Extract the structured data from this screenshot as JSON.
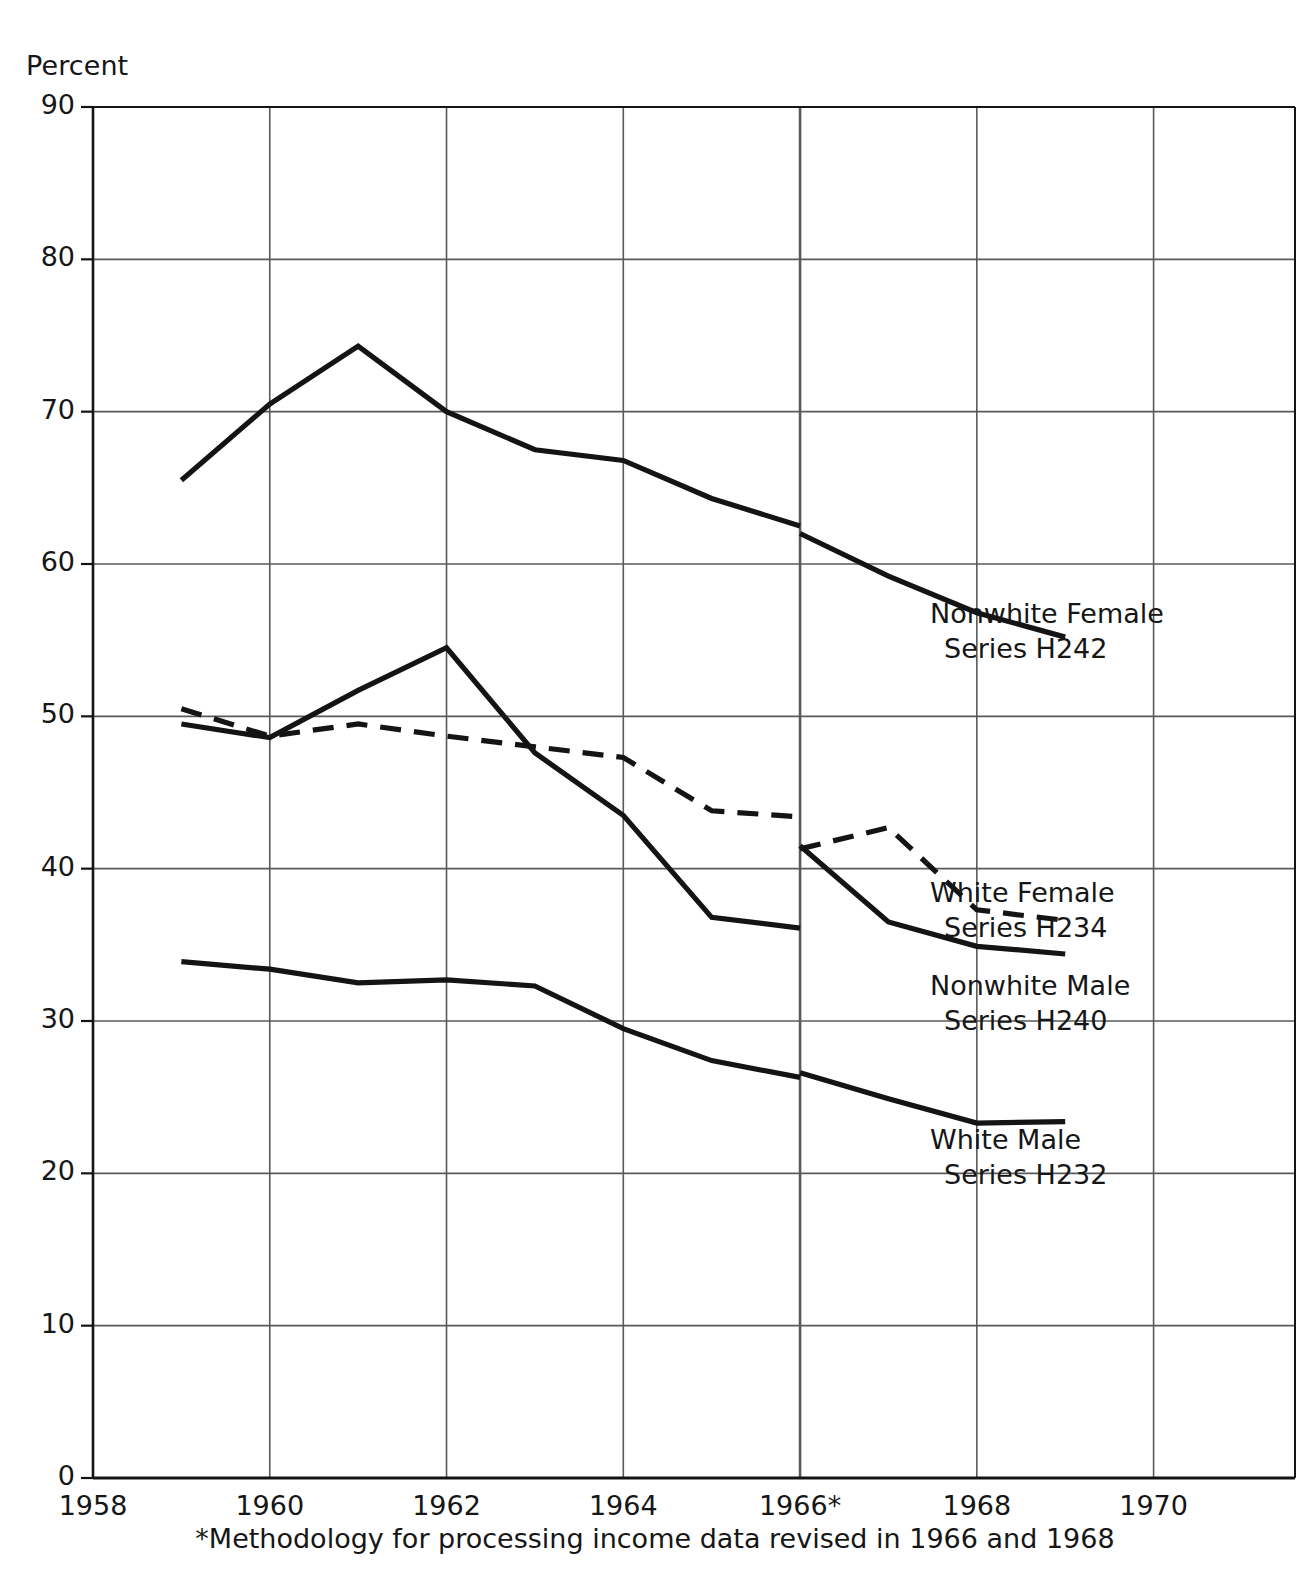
{
  "chart_data": {
    "type": "line",
    "title": "",
    "xlabel": "",
    "ylabel": "Percent",
    "xlim": [
      1958,
      1971.6
    ],
    "ylim": [
      0,
      90
    ],
    "grid": true,
    "legend_position": "inline-right",
    "ytick_labels": [
      "0",
      "10",
      "20",
      "30",
      "40",
      "50",
      "60",
      "70",
      "80",
      "90"
    ],
    "ytick_values": [
      0,
      10,
      20,
      30,
      40,
      50,
      60,
      70,
      80,
      90
    ],
    "xtick_labels": [
      "1958",
      "1960",
      "1962",
      "1964",
      "1966*",
      "1968",
      "1970"
    ],
    "xtick_values": [
      1958,
      1960,
      1962,
      1964,
      1966,
      1968,
      1970
    ],
    "annotations": [
      "*Methodology for processing income data revised in 1966 and 1968"
    ],
    "breaks": [
      1966,
      1968
    ],
    "series": [
      {
        "name": "Nonwhite Female",
        "code": "Series H242",
        "style": "solid",
        "label_line1": "Nonwhite Female",
        "label_line2": "Series H242",
        "segments": [
          {
            "x": [
              1959,
              1960,
              1961,
              1962,
              1963,
              1964,
              1965,
              1966
            ],
            "y": [
              65.5,
              70.5,
              74.3,
              70.0,
              67.5,
              66.8,
              64.3,
              62.5
            ]
          },
          {
            "x": [
              1966,
              1967,
              1968,
              1969
            ],
            "y": [
              62.0,
              59.2,
              56.8,
              55.2
            ]
          }
        ]
      },
      {
        "name": "White Female",
        "code": "Series H234",
        "style": "dashed",
        "label_line1": "White Female",
        "label_line2": "Series H234",
        "segments": [
          {
            "x": [
              1959,
              1960,
              1961,
              1962,
              1963,
              1964,
              1965,
              1966
            ],
            "y": [
              50.5,
              48.7,
              49.5,
              48.7,
              48.0,
              47.3,
              43.8,
              43.4
            ]
          },
          {
            "x": [
              1966,
              1967,
              1968,
              1969
            ],
            "y": [
              41.3,
              42.7,
              37.3,
              36.6
            ]
          }
        ]
      },
      {
        "name": "Nonwhite Male",
        "code": "Series H240",
        "style": "solid",
        "label_line1": "Nonwhite Male",
        "label_line2": "Series H240",
        "segments": [
          {
            "x": [
              1959,
              1960,
              1961,
              1962,
              1963,
              1964,
              1965,
              1966
            ],
            "y": [
              49.5,
              48.6,
              51.7,
              54.5,
              47.6,
              43.5,
              36.8,
              36.1
            ]
          },
          {
            "x": [
              1966,
              1967,
              1968,
              1969
            ],
            "y": [
              41.5,
              36.5,
              34.9,
              34.4
            ]
          }
        ]
      },
      {
        "name": "White Male",
        "code": "Series H232",
        "style": "solid",
        "label_line1": "White Male",
        "label_line2": "Series H232",
        "segments": [
          {
            "x": [
              1959,
              1960,
              1961,
              1962,
              1963,
              1964,
              1965,
              1966
            ],
            "y": [
              33.9,
              33.4,
              32.5,
              32.7,
              32.3,
              29.5,
              27.4,
              26.3
            ]
          },
          {
            "x": [
              1966,
              1967,
              1968,
              1969
            ],
            "y": [
              26.6,
              24.9,
              23.3,
              23.4
            ]
          }
        ]
      }
    ],
    "colors": {
      "line": "#141414",
      "grid": "#5a5a5a",
      "axis": "#141414",
      "background": "#ffffff"
    }
  },
  "labels": {
    "ylabel": "Percent",
    "footnote": "*Methodology for processing income data revised in 1966 and 1968"
  }
}
